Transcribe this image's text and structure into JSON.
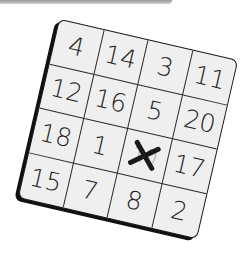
{
  "banner": {
    "color": "#b5b5b5"
  },
  "card": {
    "rows": 4,
    "cols": 4,
    "rotation_deg": 13,
    "background": "#efefef",
    "cells": [
      {
        "value": "4"
      },
      {
        "value": "14"
      },
      {
        "value": "3"
      },
      {
        "value": "11"
      },
      {
        "value": "12"
      },
      {
        "value": "16"
      },
      {
        "value": "5"
      },
      {
        "value": "20"
      },
      {
        "value": "18"
      },
      {
        "value": "1"
      },
      {
        "value": "10",
        "crossed": true
      },
      {
        "value": "17"
      },
      {
        "value": "15"
      },
      {
        "value": "7"
      },
      {
        "value": "8"
      },
      {
        "value": "2"
      }
    ],
    "crossed_mark": "x-icon"
  }
}
